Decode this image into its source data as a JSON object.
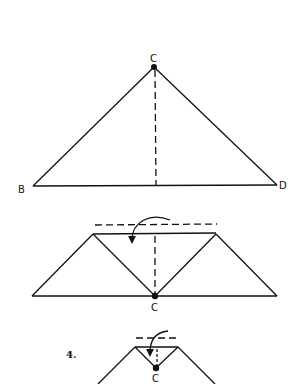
{
  "figures": [
    {
      "id": "step-triangle",
      "labels": {
        "apex": "C",
        "left": "B",
        "right": "D"
      },
      "description": "Triangle B-C-D with dashed center fold line from apex C"
    },
    {
      "id": "step-fold-down",
      "labels": {
        "bottom": "C"
      },
      "description": "Trapezoid with inner V folds meeting at C; dashed fold line above with curved arrow folding down"
    },
    {
      "id": "step-4",
      "step_number": "4.",
      "labels": {
        "bottom": "C"
      },
      "description": "Small top fold with dashed line and curved arrow pointing down to point C"
    }
  ],
  "colors": {
    "line": "#111111",
    "background": "#ffffff"
  }
}
